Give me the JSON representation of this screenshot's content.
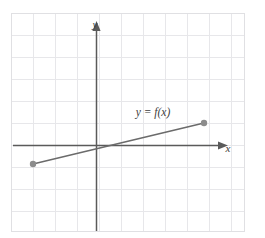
{
  "figure": {
    "width": 265,
    "height": 238,
    "background_color": "#ffffff"
  },
  "grid": {
    "line_color": "#e7e7ea",
    "border_color": "#e0e0e3",
    "spacing_px": 22,
    "left_px": 11,
    "top_px": 13,
    "right_px": 245,
    "bottom_px": 232,
    "columns": 10,
    "rows": 10
  },
  "axes": {
    "color": "#5a5a5a",
    "origin_px": {
      "x": 96,
      "y": 145
    },
    "x_axis": {
      "label": "x",
      "label_px": {
        "x": 228,
        "y": 149
      },
      "start_px": {
        "x": 13,
        "y": 145
      },
      "end_px": {
        "x": 219,
        "y": 145
      },
      "arrow": "right"
    },
    "y_axis": {
      "label": "y",
      "label_px": {
        "x": 95,
        "y": 25
      },
      "start_px": {
        "x": 96,
        "y": 231
      },
      "end_px": {
        "x": 96,
        "y": 30
      },
      "arrow": "up"
    }
  },
  "chart_data": {
    "type": "line",
    "title": "",
    "xlabel": "x",
    "ylabel": "y",
    "grid": true,
    "legend": "none",
    "series": [
      {
        "name": "y = f(x)",
        "label": "y = f(x)",
        "label_px": {
          "x": 153,
          "y": 113
        },
        "color": "#6b6b6b",
        "line_width": 1.6,
        "endpoint_marker": "closed-circle",
        "endpoint_marker_color": "#8c8c8c",
        "endpoint_marker_radius_px": 3.2,
        "points_px": [
          {
            "x": 33,
            "y": 164
          },
          {
            "x": 204,
            "y": 123
          }
        ],
        "points_grid": [
          {
            "x": -2.9,
            "y": -0.86
          },
          {
            "x": 4.9,
            "y": 1.0
          }
        ]
      }
    ],
    "xlim": [
      -3.9,
      6.8
    ],
    "ylim": [
      -3.9,
      6.0
    ]
  }
}
